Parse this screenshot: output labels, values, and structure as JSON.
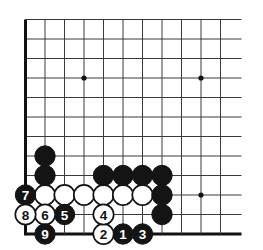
{
  "app": {
    "title": "Go board diagram",
    "kind": "go-game-diagram"
  },
  "board": {
    "size": 19,
    "view": "bottom-left corner",
    "background_color": "#ffffff",
    "line_color": "#3a3a3a",
    "edge_line_color": "#111111",
    "star_point_color": "#111111",
    "black_stone_color": "#141414",
    "white_stone_color": "#ffffff",
    "white_stone_border_color": "#141414",
    "columns_visible": 11,
    "rows_visible": 12,
    "origin_x": 25.5,
    "origin_y": 19.5,
    "spacing": 19.5,
    "stone_radius": 10.2,
    "star_points": [
      {
        "col": 4,
        "row": 4
      },
      {
        "col": 10,
        "row": 4
      },
      {
        "col": 10,
        "row": 10
      }
    ]
  },
  "stones": {
    "black_plain": [
      {
        "col": 2,
        "row": 8
      },
      {
        "col": 2,
        "row": 9
      },
      {
        "col": 5,
        "row": 9
      },
      {
        "col": 6,
        "row": 9
      },
      {
        "col": 7,
        "row": 9
      },
      {
        "col": 8,
        "row": 9
      },
      {
        "col": 8,
        "row": 10
      },
      {
        "col": 8,
        "row": 11
      }
    ],
    "white_plain": [
      {
        "col": 2,
        "row": 10
      },
      {
        "col": 3,
        "row": 10
      },
      {
        "col": 4,
        "row": 10
      },
      {
        "col": 5,
        "row": 10
      },
      {
        "col": 6,
        "row": 10
      },
      {
        "col": 7,
        "row": 10
      }
    ],
    "numbered": [
      {
        "label": "1",
        "color": "black",
        "col": 6,
        "row": 12
      },
      {
        "label": "2",
        "color": "white",
        "col": 5,
        "row": 12
      },
      {
        "label": "3",
        "color": "black",
        "col": 7,
        "row": 12
      },
      {
        "label": "4",
        "color": "white",
        "col": 5,
        "row": 11
      },
      {
        "label": "5",
        "color": "black",
        "col": 3,
        "row": 11
      },
      {
        "label": "6",
        "color": "white",
        "col": 2,
        "row": 11
      },
      {
        "label": "7",
        "color": "black",
        "col": 1,
        "row": 10
      },
      {
        "label": "8",
        "color": "white",
        "col": 1,
        "row": 11
      },
      {
        "label": "9",
        "color": "black",
        "col": 2,
        "row": 12
      }
    ]
  }
}
